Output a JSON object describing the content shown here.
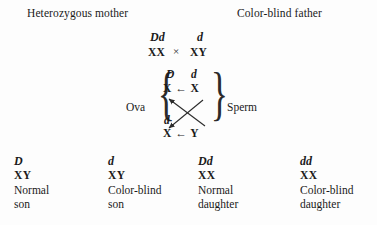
{
  "header": {
    "mother_label": "Heterozygous mother",
    "father_label": "Color-blind father"
  },
  "cross": {
    "mother_allele": "Dd",
    "mother_chromosomes": "XX",
    "cross_symbol": "×",
    "father_allele": "d",
    "father_chromosomes": "XY"
  },
  "gametes": {
    "ova_label": "Ova",
    "sperm_label": "Sperm",
    "top_ovum_allele": "D",
    "top_sperm_allele": "d",
    "top_row": "X ← X",
    "bottom_ovum_allele": "d",
    "bottom_row": "X ← Y"
  },
  "offspring": [
    {
      "genotype": "D",
      "chromosomes": "XY",
      "description_line1": "Normal",
      "description_line2": "son"
    },
    {
      "genotype": "d",
      "chromosomes": "XY",
      "description_line1": "Color-blind",
      "description_line2": "son"
    },
    {
      "genotype": "Dd",
      "chromosomes": "XX",
      "description_line1": "Normal",
      "description_line2": "daughter"
    },
    {
      "genotype": "dd",
      "chromosomes": "XX",
      "description_line1": "Color-blind",
      "description_line2": "daughter"
    }
  ],
  "colors": {
    "background": "#fdfdfd",
    "text": "#1a1a1a"
  }
}
